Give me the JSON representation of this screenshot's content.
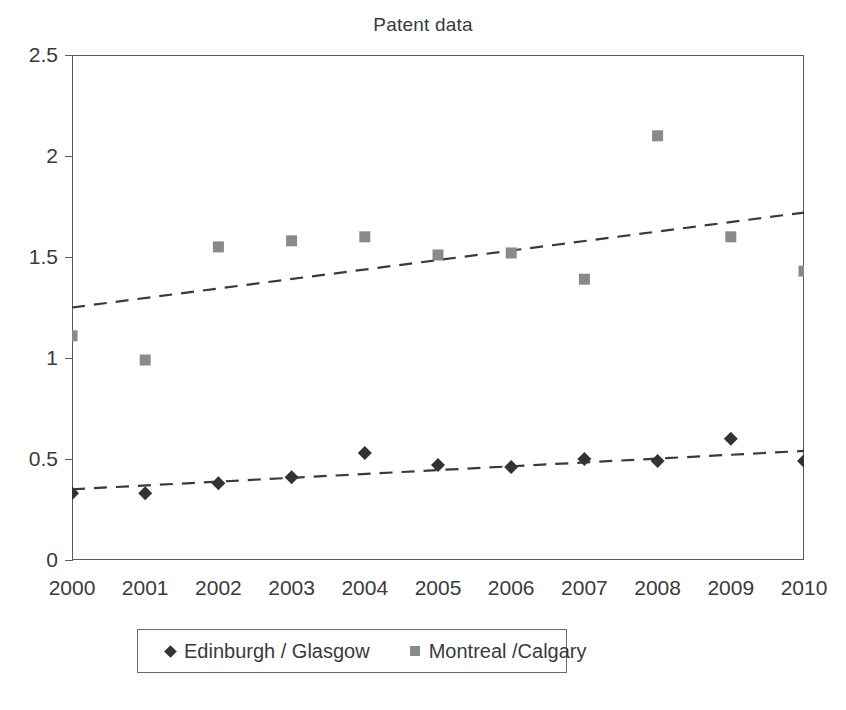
{
  "chart_data": {
    "type": "scatter",
    "title": "Patent data",
    "xlabel": "",
    "ylabel": "",
    "grid": false,
    "legend_position": "bottom",
    "categories": [
      "2000",
      "2001",
      "2002",
      "2003",
      "2004",
      "2005",
      "2006",
      "2007",
      "2008",
      "2009",
      "2010"
    ],
    "x": [
      2000,
      2001,
      2002,
      2003,
      2004,
      2005,
      2006,
      2007,
      2008,
      2009,
      2010
    ],
    "xlim": [
      2000,
      2010
    ],
    "ylim": [
      0,
      2.5
    ],
    "ytick_labels": [
      "0",
      "0.5",
      "1",
      "1.5",
      "2",
      "2.5"
    ],
    "ytick_values": [
      0,
      0.5,
      1,
      1.5,
      2,
      2.5
    ],
    "series": [
      {
        "name": "Edinburgh / Glasgow",
        "marker": "diamond",
        "color": "#333333",
        "values": [
          0.33,
          0.33,
          0.38,
          0.41,
          0.53,
          0.47,
          0.46,
          0.5,
          0.49,
          0.6,
          0.49
        ],
        "trendline": {
          "style": "dashed",
          "color": "#3a3a3a",
          "start": {
            "x": 2000,
            "y": 0.35
          },
          "end": {
            "x": 2010,
            "y": 0.54
          }
        }
      },
      {
        "name": "Montreal /Calgary",
        "marker": "square",
        "color": "#8a8a8a",
        "values": [
          1.11,
          0.99,
          1.55,
          1.58,
          1.6,
          1.51,
          1.52,
          1.39,
          2.1,
          1.6,
          1.43
        ],
        "trendline": {
          "style": "dashed",
          "color": "#3a3a3a",
          "start": {
            "x": 2000,
            "y": 1.25
          },
          "end": {
            "x": 2010,
            "y": 1.72
          }
        }
      }
    ]
  },
  "legend": {
    "entries": [
      {
        "label": "Edinburgh / Glasgow",
        "marker": "diamond"
      },
      {
        "label": "Montreal /Calgary",
        "marker": "square"
      }
    ]
  },
  "colors": {
    "axis": "#5a5a5a",
    "text": "#3a3a3a",
    "series_1": "#333333",
    "series_2": "#8a8a8a",
    "background": "#ffffff"
  }
}
